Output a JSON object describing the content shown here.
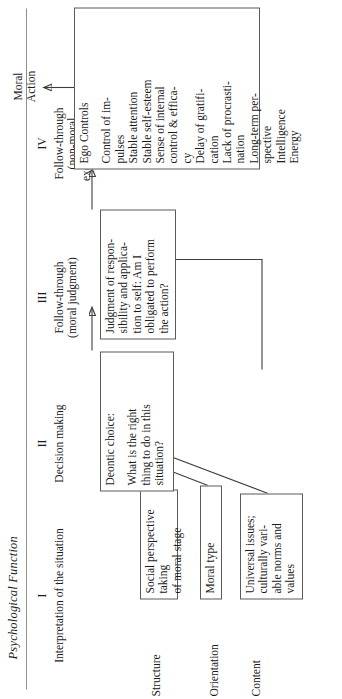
{
  "figure": {
    "title": "Psychological Function"
  },
  "columns": [
    {
      "num": "I",
      "caption": "Interpretation of the situation"
    },
    {
      "num": "II",
      "caption": "Decision making"
    },
    {
      "num": "III",
      "caption": "Follow-through\n(moral judgment)"
    },
    {
      "num": "IV",
      "caption": "Follow-through\n(non-moral\nexecutive skills)"
    }
  ],
  "rows": [
    {
      "label": "Structure"
    },
    {
      "label": "Orientation"
    },
    {
      "label": "Content"
    }
  ],
  "boxes": {
    "structure": {
      "text": "Social perspective taking\nof moral stage"
    },
    "orientation": {
      "text": "Moral type"
    },
    "content": {
      "text": "Universal issues;\nculturally vari-\nable norms and\nvalues"
    },
    "deontic": {
      "header": "Deontic choice:",
      "text": "What is the right\nthing to do in this\nsituation?"
    },
    "judgment": {
      "text": "Judgment of respon-\nsibility and applica-\ntion to self:  Am I\nobligated to perform\nthe action?"
    },
    "ego": {
      "header": "Ego Controls",
      "items": "Control of im-\npulses\nStable attention\nStable self-esteem\nSense of internal\ncontrol & effica-\ncy\nDelay of gratifi-\ncation\nLack of procrasti-\nnation\nLong-term per-\nspective\nIntelligence\nEnergy"
    }
  },
  "outcome": {
    "label": "Moral\nAction"
  },
  "colors": {
    "ink": "#1a1a1a",
    "box_border": "#5b5b5b",
    "rule": "#8e8e8e",
    "connector": "#3d3d3d",
    "page": "#ffffff"
  }
}
